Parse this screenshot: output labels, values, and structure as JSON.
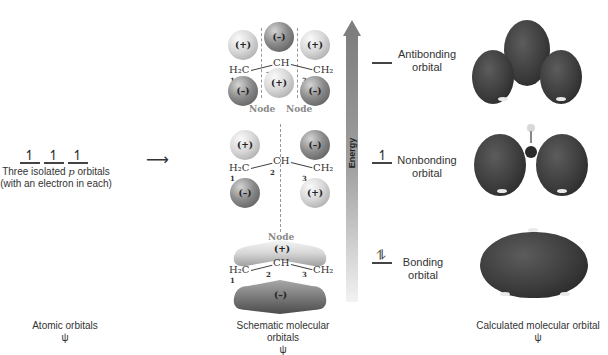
{
  "atomic": {
    "electron_glyph": "↿",
    "caption_line1_pre": "Three isolated ",
    "caption_line1_italic": "p",
    "caption_line1_post": " orbitals",
    "caption_line2": "(with an electron in each)",
    "arrow": "⟶",
    "footer_label": "Atomic orbitals",
    "footer_symbol": "ψ"
  },
  "schematic": {
    "footer_label": "Schematic molecular orbitals",
    "footer_symbol": "ψ",
    "formula": {
      "left": "H₂C",
      "center": "CH",
      "right": "CH₂",
      "num1": "1",
      "num2": "2",
      "num3": "3"
    },
    "antibonding": {
      "top_lobes": [
        "(+)",
        "(–)",
        "(+)"
      ],
      "bottom_lobes": [
        "(–)",
        "(+)",
        "(–)"
      ],
      "node_labels": [
        "Node",
        "Node"
      ]
    },
    "nonbonding": {
      "top_lobes": [
        "(+)",
        "(–)"
      ],
      "bottom_lobes": [
        "(–)",
        "(+)"
      ],
      "node_label": "Node"
    },
    "bonding": {
      "top_lobe": "(+)",
      "bottom_lobe": "(–)"
    }
  },
  "energy": {
    "axis_label": "Energy",
    "arrow_color": "#8a8a8a",
    "levels": [
      {
        "name": "Antibonding",
        "line2": "orbital",
        "electrons": ""
      },
      {
        "name": "Nonbonding",
        "line2": "orbital",
        "electrons": "↿"
      },
      {
        "name": "Bonding",
        "line2": "orbital",
        "electrons": "⥮"
      }
    ]
  },
  "calculated": {
    "footer_label": "Calculated molecular orbital",
    "footer_symbol": "ψ"
  }
}
